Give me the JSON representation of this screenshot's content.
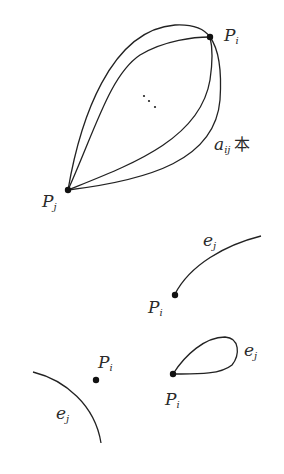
{
  "figure_top": {
    "vertex_i": {
      "name": "P",
      "subscript": "i"
    },
    "vertex_j": {
      "name": "P",
      "subscript": "j"
    },
    "multiplicity_label": {
      "name": "a",
      "subscript": "ij",
      "suffix": "本"
    },
    "ellipsis": "⋰"
  },
  "figure_middle": {
    "vertex": {
      "name": "P",
      "subscript": "i"
    },
    "edge": {
      "name": "e",
      "subscript": "j"
    }
  },
  "figure_bottom_left": {
    "vertex": {
      "name": "P",
      "subscript": "i"
    },
    "edge": {
      "name": "e",
      "subscript": "j"
    }
  },
  "figure_bottom_right": {
    "vertex": {
      "name": "P",
      "subscript": "i"
    },
    "edge": {
      "name": "e",
      "subscript": "j"
    }
  },
  "colors": {
    "stroke": "#222222",
    "background": "#ffffff"
  }
}
